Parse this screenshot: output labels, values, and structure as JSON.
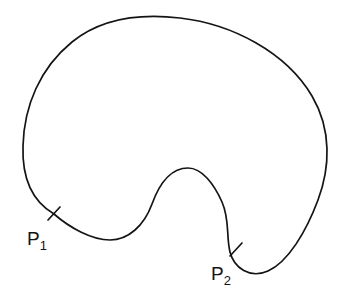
{
  "figure": {
    "background_color": "#ffffff",
    "stroke_color": "#141414",
    "stroke_width": 1.7,
    "width": 343,
    "height": 298,
    "curve": {
      "name": "kidney-shaped-closed-curve",
      "closed": true,
      "description": "Closed bean/kidney shaped curve with a concave notch at bottom center",
      "path": "M 54 214 C 30 200 22 176 23 146 C 24 106 40 68 72 42 C 104 16 146 14 180 18 C 232 24 286 52 312 96 C 332 130 330 168 318 200 C 306 232 288 262 268 271 C 250 279 234 268 230 252 C 226 236 230 220 222 202 C 214 184 202 168 188 168 C 172 168 160 182 152 204 C 144 226 128 240 110 240 C 92 240 70 228 54 214 Z"
    },
    "points": [
      {
        "id": "P1",
        "label_main": "P",
        "label_sub": "1",
        "tick_x": 54,
        "tick_y": 214,
        "tick_path": "M 48 220 L 60 207",
        "label_x": 27,
        "label_y": 245
      },
      {
        "id": "P2",
        "label_main": "P",
        "label_sub": "2",
        "tick_x": 236,
        "tick_y": 250,
        "tick_path": "M 230 256 L 242 243",
        "label_x": 211,
        "label_y": 280
      }
    ]
  }
}
